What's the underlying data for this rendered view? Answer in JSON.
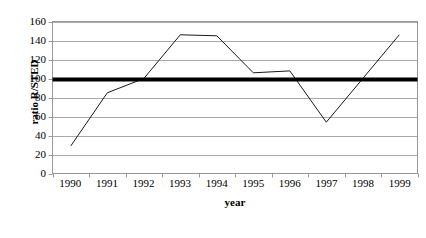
{
  "chart_data": {
    "type": "line",
    "title": "",
    "xlabel": "year",
    "ylabel": "ratio R/STED",
    "categories": [
      "1990",
      "1991",
      "1992",
      "1993",
      "1994",
      "1995",
      "1996",
      "1997",
      "1998",
      "1999"
    ],
    "series": [
      {
        "name": "ratio R/STED",
        "values": [
          29,
          85,
          100,
          146,
          145,
          106,
          108,
          54,
          100,
          146
        ],
        "color": "#1a1a1a",
        "line_width": 1
      }
    ],
    "reference_line": {
      "name": "reference",
      "value": 100,
      "color": "#000000",
      "line_width": 4
    },
    "ylim": [
      0,
      160
    ],
    "yticks": [
      0,
      20,
      40,
      60,
      80,
      100,
      120,
      140,
      160
    ],
    "ytick_labels": [
      "0",
      "20",
      "40",
      "60",
      "80",
      "100",
      "120",
      "140",
      "160"
    ],
    "grid": true,
    "grid_color": "#aaaaaa",
    "legend": false,
    "legend_position": "none",
    "plot_border_color": "#999999",
    "background_color": "#ffffff"
  }
}
